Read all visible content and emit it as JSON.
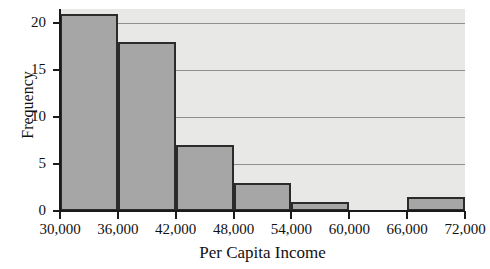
{
  "chart_data": {
    "type": "bar",
    "title": "",
    "subtitle": "",
    "xlabel": "Per Capita Income",
    "ylabel": "Frequency",
    "categories": [
      "30,000-36,000",
      "36,000-42,000",
      "42,000-48,000",
      "48,000-54,000",
      "54,000-60,000",
      "60,000-66,000",
      "66,000-72,000"
    ],
    "bin_edges": [
      30000,
      36000,
      42000,
      48000,
      54000,
      60000,
      66000,
      72000
    ],
    "values": [
      21,
      18,
      7,
      3,
      1,
      0,
      1.5
    ],
    "xlim": [
      30000,
      72000
    ],
    "ylim": [
      0,
      21.5
    ],
    "xticks": [
      "30,000",
      "36,000",
      "42,000",
      "48,000",
      "54,000",
      "60,000",
      "66,000",
      "72,000"
    ],
    "xtick_values": [
      30000,
      36000,
      42000,
      48000,
      54000,
      60000,
      66000,
      72000
    ],
    "yticks": [
      "0",
      "5",
      "10",
      "15",
      "20"
    ],
    "ytick_values": [
      0,
      5,
      10,
      15,
      20
    ],
    "grid": "horizontal",
    "legend": null,
    "colors": {
      "bar_fill": "#a6a6a6",
      "bar_edge": "#2b2b2b",
      "plot_background": "#e8e8e6",
      "gridline": "#8f8f8f",
      "axis": "#1a1a1a",
      "text": "#111111"
    }
  }
}
